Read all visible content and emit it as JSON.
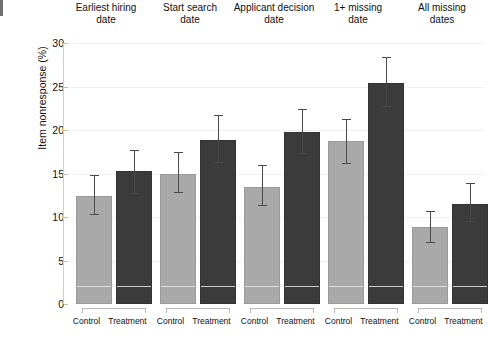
{
  "chart_data": {
    "type": "bar",
    "title": "",
    "xlabel": "",
    "ylabel": "Item nonresponse (%)",
    "ylim": [
      0,
      30
    ],
    "yticks": [
      "0",
      "5",
      "10",
      "15",
      "20",
      "25",
      "30"
    ],
    "grid": true,
    "legend": "none",
    "group_labels": [
      "Control",
      "Treatment"
    ],
    "categories": [
      "Earliest hiring date",
      "Start search date",
      "Applicant decision date",
      "1+ missing date",
      "All missing dates"
    ],
    "series": [
      {
        "name": "Control",
        "color": "#a9a9a9",
        "values": [
          12.4,
          15.0,
          13.5,
          18.7,
          8.8
        ],
        "error_low": [
          10.2,
          12.8,
          11.3,
          16.1,
          7.0
        ],
        "error_high": [
          14.7,
          17.4,
          15.9,
          21.2,
          10.6
        ]
      },
      {
        "name": "Treatment",
        "color": "#3b3b3b",
        "values": [
          15.3,
          18.9,
          19.8,
          25.4,
          11.5
        ],
        "error_low": [
          12.7,
          16.2,
          17.3,
          22.6,
          9.4
        ],
        "error_high": [
          17.6,
          21.6,
          22.3,
          28.3,
          13.8
        ]
      }
    ],
    "panels": [
      {
        "title_line1": "Earliest hiring",
        "title_line2": "date",
        "bars": [
          {
            "group": "Control",
            "value": 12.4,
            "lo": 10.2,
            "hi": 14.7
          },
          {
            "group": "Treatment",
            "value": 15.3,
            "lo": 12.7,
            "hi": 17.6
          }
        ]
      },
      {
        "title_line1": "Start search",
        "title_line2": "date",
        "bars": [
          {
            "group": "Control",
            "value": 15.0,
            "lo": 12.8,
            "hi": 17.4
          },
          {
            "group": "Treatment",
            "value": 18.9,
            "lo": 16.2,
            "hi": 21.6
          }
        ]
      },
      {
        "title_line1": "Applicant decision",
        "title_line2": "date",
        "bars": [
          {
            "group": "Control",
            "value": 13.5,
            "lo": 11.3,
            "hi": 15.9
          },
          {
            "group": "Treatment",
            "value": 19.8,
            "lo": 17.3,
            "hi": 22.3
          }
        ]
      },
      {
        "title_line1": "1+ missing",
        "title_line2": "date",
        "bars": [
          {
            "group": "Control",
            "value": 18.7,
            "lo": 16.1,
            "hi": 21.2
          },
          {
            "group": "Treatment",
            "value": 25.4,
            "lo": 22.6,
            "hi": 28.3
          }
        ]
      },
      {
        "title_line1": "All missing",
        "title_line2": "dates",
        "bars": [
          {
            "group": "Control",
            "value": 8.8,
            "lo": 7.0,
            "hi": 10.6
          },
          {
            "group": "Treatment",
            "value": 11.5,
            "lo": 9.4,
            "hi": 13.8
          }
        ]
      }
    ],
    "inner_reference_value": 1.8
  }
}
